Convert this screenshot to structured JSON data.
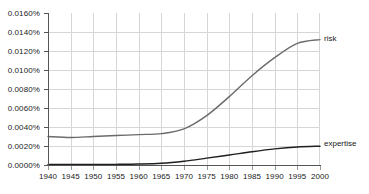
{
  "chart_data": {
    "type": "line",
    "title": "",
    "xlabel": "",
    "ylabel": "",
    "xlim": [
      1940,
      2000
    ],
    "ylim": [
      0.0,
      0.016
    ],
    "grid": true,
    "legend_position": "right-inline",
    "x": [
      1940,
      1945,
      1950,
      1955,
      1960,
      1965,
      1970,
      1975,
      1980,
      1985,
      1990,
      1995,
      2000
    ],
    "x_tick_labels": [
      "1940",
      "1945",
      "1950",
      "1955",
      "1960",
      "1965",
      "1970",
      "1975",
      "1980",
      "1985",
      "1990",
      "1995",
      "2000"
    ],
    "y_tick_labels": [
      "0.0160%",
      "0.0140%",
      "0.0120%",
      "0.0100%",
      "0.0080%",
      "0.0060%",
      "0.0040%",
      "0.0020%",
      "0.0000%"
    ],
    "y_ticks": [
      0.016,
      0.014,
      0.012,
      0.01,
      0.008,
      0.006,
      0.004,
      0.002,
      0.0
    ],
    "series": [
      {
        "name": "risk",
        "label": "risk",
        "color": "#6b6b6b",
        "values": [
          0.003,
          0.0029,
          0.003,
          0.0031,
          0.0032,
          0.0033,
          0.0038,
          0.0052,
          0.0072,
          0.0094,
          0.0113,
          0.0128,
          0.0132
        ]
      },
      {
        "name": "expertise",
        "label": "expertise",
        "color": "#1f1f1f",
        "values": [
          5e-05,
          5e-05,
          6e-05,
          7e-05,
          0.0001,
          0.00018,
          0.0004,
          0.00072,
          0.00105,
          0.0014,
          0.0017,
          0.0019,
          0.00198
        ]
      }
    ]
  }
}
